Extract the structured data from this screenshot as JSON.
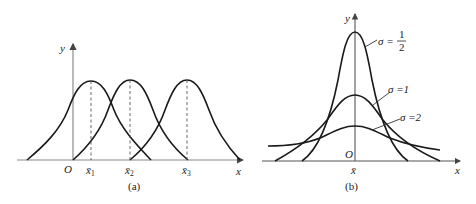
{
  "figure": {
    "panel_a": {
      "caption": "(a)",
      "y_label": "y",
      "x_label": "x",
      "origin_label": "O",
      "means": [
        {
          "label": "x̄",
          "sub": "1"
        },
        {
          "label": "x̄",
          "sub": "2"
        },
        {
          "label": "x̄",
          "sub": "3"
        }
      ]
    },
    "panel_b": {
      "caption": "(b)",
      "y_label": "y",
      "x_label": "x",
      "origin_label": "O",
      "mean_label": "x̄",
      "curves": [
        {
          "sigma_label": "σ =",
          "num": "1",
          "den": "2"
        },
        {
          "sigma_label": "σ =1"
        },
        {
          "sigma_label": "σ =2"
        }
      ]
    }
  },
  "colors": {
    "curve": "#1a1a1a",
    "axis": "#8a8a8a"
  }
}
